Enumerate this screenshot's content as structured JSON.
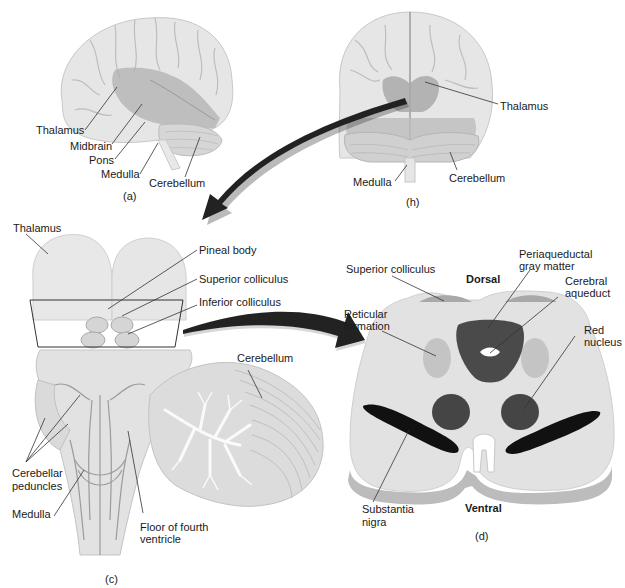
{
  "figure": {
    "panels": [
      {
        "id": "a",
        "caption": "(a)",
        "view": "lateral view of brain",
        "labels": [
          "Thalamus",
          "Midbrain",
          "Pons",
          "Medulla",
          "Cerebellum"
        ]
      },
      {
        "id": "h",
        "caption": "(h)",
        "view": "posterior view of brain",
        "labels": [
          "Thalamus",
          "Medulla",
          "Cerebellum"
        ]
      },
      {
        "id": "c",
        "caption": "(c)",
        "view": "dorsal view of brainstem",
        "labels": [
          "Thalamus",
          "Pineal body",
          "Superior colliculus",
          "Inferior colliculus",
          "Cerebellum",
          "Cerebellar peduncles",
          "Medulla",
          "Floor of fourth ventricle"
        ]
      },
      {
        "id": "d",
        "caption": "(d)",
        "view": "cross section of midbrain",
        "orientation": {
          "top": "Dorsal",
          "bottom": "Ventral"
        },
        "labels": [
          "Superior colliculus",
          "Periaqueductal gray matter",
          "Cerebral aqueduct",
          "Reticular formation",
          "Red nucleus",
          "Substantia nigra"
        ]
      }
    ]
  },
  "panel_a": {
    "thalamus": "Thalamus",
    "midbrain": "Midbrain",
    "pons": "Pons",
    "medulla": "Medulla",
    "cerebellum": "Cerebellum",
    "caption": "(a)"
  },
  "panel_h": {
    "thalamus": "Thalamus",
    "medulla": "Medulla",
    "cerebellum": "Cerebellum",
    "caption": "(h)"
  },
  "panel_c": {
    "thalamus": "Thalamus",
    "pineal_body": "Pineal body",
    "superior_colliculus": "Superior colliculus",
    "inferior_colliculus": "Inferior colliculus",
    "cerebellum": "Cerebellum",
    "cerebellar_peduncles_1": "Cerebellar",
    "cerebellar_peduncles_2": "peduncles",
    "medulla": "Medulla",
    "floor_1": "Floor of fourth",
    "floor_2": "ventricle",
    "caption": "(c)"
  },
  "panel_d": {
    "superior_colliculus": "Superior colliculus",
    "dorsal": "Dorsal",
    "periaqueductal_1": "Periaqueductal",
    "periaqueductal_2": "gray matter",
    "cerebral_aqueduct_1": "Cerebral",
    "cerebral_aqueduct_2": "aqueduct",
    "reticular_1": "Reticular",
    "reticular_2": "formation",
    "red_nucleus_1": "Red",
    "red_nucleus_2": "nucleus",
    "substantia_1": "Substantia",
    "substantia_2": "nigra",
    "ventral": "Ventral",
    "caption": "(d)"
  },
  "colors": {
    "brain_light": "#e4e4e4",
    "brain_mid": "#cfcfcf",
    "highlight": "#a8a8a8",
    "dark_nucleus": "#4a4a4a",
    "black_nigra": "#111111",
    "arrow": "#222222",
    "section_fill": "#e2e2e2",
    "reticular": "#c4c4c4",
    "colliculus": "#a9a9a9"
  }
}
